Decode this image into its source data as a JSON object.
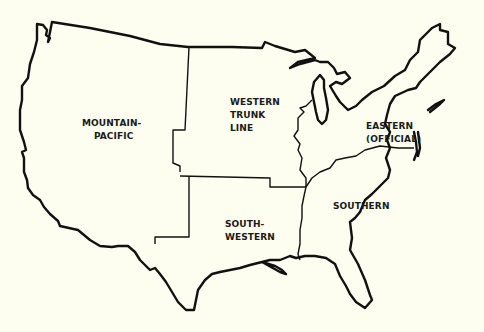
{
  "map": {
    "title": "Railroad Freight Territories of the United States",
    "colors": {
      "background": "#fdfdf0",
      "outline": "#111111",
      "text": "#1a1a1a"
    },
    "regions": [
      {
        "id": "mountain-pacific",
        "lines": [
          "MOUNTAIN-",
          "PACIFIC"
        ]
      },
      {
        "id": "western-trunk-line",
        "lines": [
          "WESTERN",
          "TRUNK",
          "LINE"
        ]
      },
      {
        "id": "eastern-official",
        "lines": [
          "EASTERN",
          "(OFFICIAL)"
        ]
      },
      {
        "id": "south-western",
        "lines": [
          "SOUTH-",
          "WESTERN"
        ]
      },
      {
        "id": "southern",
        "lines": [
          "SOUTHERN"
        ]
      }
    ]
  }
}
